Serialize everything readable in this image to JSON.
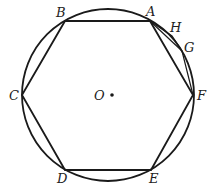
{
  "diagram": {
    "circle": {
      "cx": 108,
      "cy": 95,
      "r": 86
    },
    "center_label": "O",
    "vertices": [
      {
        "name": "A",
        "x": 150,
        "y": 21
      },
      {
        "name": "B",
        "x": 65,
        "y": 21
      },
      {
        "name": "C",
        "x": 22,
        "y": 95
      },
      {
        "name": "D",
        "x": 65,
        "y": 170
      },
      {
        "name": "E",
        "x": 151,
        "y": 170
      },
      {
        "name": "F",
        "x": 193,
        "y": 95
      }
    ],
    "arc_points": [
      {
        "name": "H",
        "x": 172,
        "y": 36
      },
      {
        "name": "G",
        "x": 182,
        "y": 51
      }
    ],
    "labels": {
      "A": "A",
      "B": "B",
      "C": "C",
      "D": "D",
      "E": "E",
      "F": "F",
      "G": "G",
      "H": "H",
      "O": "O"
    }
  }
}
